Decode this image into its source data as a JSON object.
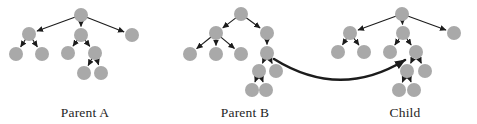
{
  "figure": {
    "background_color": "#ffffff",
    "node_color": "#a9a9a9",
    "edge_color": "#1c1c1c",
    "crossover_arrow_color": "#1c1c1c",
    "label_color": "#1f1f1f",
    "node_radius": 7,
    "edge_width": 1.1,
    "crossover_arrow_width": 2.6,
    "trees": [
      {
        "id": "parent-a",
        "label": "Parent A",
        "label_cx": 85,
        "label_top": 106,
        "nodes": [
          {
            "id": "root",
            "x": 81,
            "y": 15
          },
          {
            "id": "l",
            "x": 29,
            "y": 34
          },
          {
            "id": "m",
            "x": 81,
            "y": 35
          },
          {
            "id": "r",
            "x": 132,
            "y": 35
          },
          {
            "id": "ll",
            "x": 16,
            "y": 54
          },
          {
            "id": "lr",
            "x": 42,
            "y": 54
          },
          {
            "id": "ml",
            "x": 68,
            "y": 53
          },
          {
            "id": "mr",
            "x": 95,
            "y": 53
          },
          {
            "id": "mrl",
            "x": 84,
            "y": 73
          },
          {
            "id": "mrr",
            "x": 101,
            "y": 73
          }
        ],
        "edges": [
          [
            "root",
            "l"
          ],
          [
            "root",
            "m"
          ],
          [
            "root",
            "r"
          ],
          [
            "l",
            "ll"
          ],
          [
            "l",
            "lr"
          ],
          [
            "m",
            "ml"
          ],
          [
            "m",
            "mr"
          ],
          [
            "mr",
            "mrl"
          ],
          [
            "mr",
            "mrr"
          ]
        ]
      },
      {
        "id": "parent-b",
        "label": "Parent B",
        "label_cx": 245,
        "label_top": 106,
        "nodes": [
          {
            "id": "root",
            "x": 241,
            "y": 14
          },
          {
            "id": "l",
            "x": 216,
            "y": 33
          },
          {
            "id": "r",
            "x": 267,
            "y": 33
          },
          {
            "id": "l1",
            "x": 190,
            "y": 54
          },
          {
            "id": "l2",
            "x": 216,
            "y": 54
          },
          {
            "id": "l3",
            "x": 241,
            "y": 54
          },
          {
            "id": "r1",
            "x": 267,
            "y": 53
          },
          {
            "id": "r1a",
            "x": 259,
            "y": 71
          },
          {
            "id": "r1b",
            "x": 276,
            "y": 71
          },
          {
            "id": "r1a1",
            "x": 252,
            "y": 90
          },
          {
            "id": "r1a2",
            "x": 266,
            "y": 90
          }
        ],
        "edges": [
          [
            "root",
            "l"
          ],
          [
            "root",
            "r"
          ],
          [
            "l",
            "l1"
          ],
          [
            "l",
            "l2"
          ],
          [
            "l",
            "l3"
          ],
          [
            "r",
            "r1"
          ],
          [
            "r1",
            "r1a"
          ],
          [
            "r1",
            "r1b"
          ],
          [
            "r1a",
            "r1a1"
          ],
          [
            "r1a",
            "r1a2"
          ]
        ]
      },
      {
        "id": "child",
        "label": "Child",
        "label_cx": 405,
        "label_top": 106,
        "nodes": [
          {
            "id": "root",
            "x": 402,
            "y": 14
          },
          {
            "id": "l",
            "x": 350,
            "y": 33
          },
          {
            "id": "m",
            "x": 403,
            "y": 33
          },
          {
            "id": "r",
            "x": 454,
            "y": 33
          },
          {
            "id": "ll",
            "x": 338,
            "y": 52
          },
          {
            "id": "lr",
            "x": 364,
            "y": 52
          },
          {
            "id": "ml",
            "x": 390,
            "y": 52
          },
          {
            "id": "mr",
            "x": 416,
            "y": 52
          },
          {
            "id": "mra",
            "x": 407,
            "y": 71
          },
          {
            "id": "mrb",
            "x": 425,
            "y": 71
          },
          {
            "id": "mra1",
            "x": 399,
            "y": 90
          },
          {
            "id": "mra2",
            "x": 414,
            "y": 90
          }
        ],
        "edges": [
          [
            "root",
            "l"
          ],
          [
            "root",
            "m"
          ],
          [
            "root",
            "r"
          ],
          [
            "l",
            "ll"
          ],
          [
            "l",
            "lr"
          ],
          [
            "m",
            "ml"
          ],
          [
            "m",
            "mr"
          ],
          [
            "mr",
            "mra"
          ],
          [
            "mr",
            "mrb"
          ],
          [
            "mra",
            "mra1"
          ],
          [
            "mra",
            "mra2"
          ]
        ]
      }
    ],
    "crossover_arrow": {
      "from_x": 274,
      "from_y": 59,
      "ctrl_x": 340,
      "ctrl_y": 100,
      "to_x": 405,
      "to_y": 60
    }
  }
}
